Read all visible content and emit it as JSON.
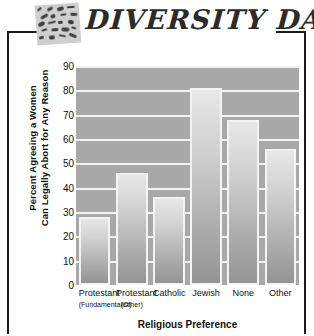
{
  "header": {
    "title": "Diversity Data",
    "logo_icon": "mosaic-tiles-icon"
  },
  "chart_data": {
    "type": "bar",
    "title": "",
    "categories": [
      "Protestant",
      "Protestant",
      "Catholic",
      "Jewish",
      "None",
      "Other"
    ],
    "category_sublabels": [
      "(Fundamentalist)",
      "(Other)",
      "",
      "",
      "",
      ""
    ],
    "values": [
      28,
      46,
      36,
      81,
      68,
      56
    ],
    "xlabel": "Religious Preference",
    "ylabel": "Percent Agreeing a Women Can Legally Abort for Any Reason",
    "ylabel_line1": "Percent Agreeing a Women",
    "ylabel_line2": "Can Legally Abort for Any Reason",
    "ylim": [
      0,
      90
    ],
    "ytick_step": 10,
    "yticks": [
      90,
      80,
      70,
      60,
      50,
      40,
      30,
      20,
      10,
      0
    ],
    "grid": true,
    "legend": "none",
    "colors": {
      "plot_background": "#a8a8a8",
      "gridline": "#f2f2f2",
      "bar_top": "#e7e7e7",
      "bar_bottom": "#949494",
      "bar_outline": "#f4f4f4",
      "text": "#111111",
      "frame": "#1a1a1a"
    }
  }
}
